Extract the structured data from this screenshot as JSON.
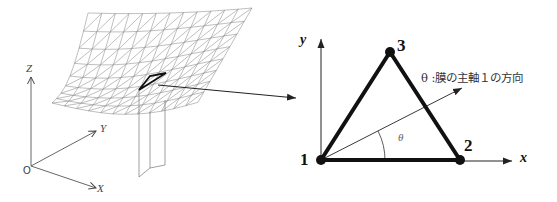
{
  "figure": {
    "left_panel": {
      "global_axes": {
        "origin_label": "O",
        "x_label": "X",
        "y_label": "Y",
        "z_label": "Z"
      },
      "mesh": {
        "type": "triangulated curved membrane surface",
        "highlighted_element": "triangle"
      }
    },
    "right_panel": {
      "local_axes": {
        "x_label": "x",
        "y_label": "y"
      },
      "nodes": [
        {
          "id": "1",
          "label": "1"
        },
        {
          "id": "2",
          "label": "2"
        },
        {
          "id": "3",
          "label": "3"
        }
      ],
      "angle_label": "θ",
      "principal_axis_note": "θ :膜の主軸１の方向"
    },
    "colors": {
      "mesh_line": "#8a8a8a",
      "element_edge": "#111111",
      "axis": "#333333",
      "background": "#ffffff"
    }
  }
}
